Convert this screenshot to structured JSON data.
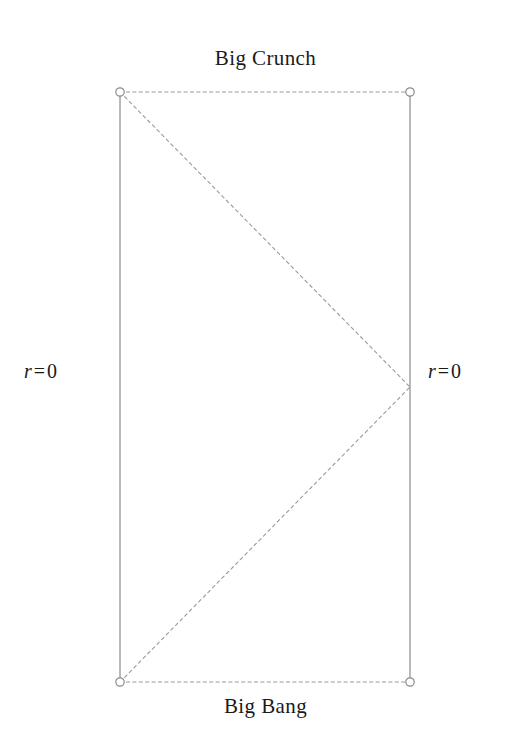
{
  "figure": {
    "type": "conformal-spacetime-diagram",
    "background_color": "#ffffff",
    "width": 507,
    "height": 734,
    "line_color": "#8a8a8a",
    "dotted_color": "#9a9a9a",
    "text_color": "#1a1a1a",
    "vertex_fill": "#ffffff"
  },
  "labels": {
    "top": "Big Crunch",
    "bottom": "Big Bang",
    "left_axis": "r = 0",
    "right_axis": "r = 0",
    "math": {
      "symbol": "r",
      "equals": "=",
      "value": "0"
    }
  },
  "chart_data": {
    "type": "diagram",
    "title": "Big Crunch",
    "subtitle": "Big Bang",
    "xlabel": "",
    "ylabel": "",
    "axis_labels": [
      "r = 0",
      "r = 0"
    ],
    "vertices": [
      {
        "name": "top-left",
        "x": 120,
        "y": 92,
        "marker": "open-circle"
      },
      {
        "name": "top-right",
        "x": 410,
        "y": 92,
        "marker": "open-circle"
      },
      {
        "name": "bottom-left",
        "x": 120,
        "y": 682,
        "marker": "open-circle"
      },
      {
        "name": "bottom-right",
        "x": 410,
        "y": 682,
        "marker": "open-circle"
      },
      {
        "name": "right-apex",
        "x": 410,
        "y": 387,
        "marker": "none"
      }
    ],
    "edges": [
      {
        "name": "left-axis",
        "from": "top-left",
        "to": "bottom-left",
        "style": "solid",
        "meaning": "r = 0"
      },
      {
        "name": "right-axis",
        "from": "top-right",
        "to": "bottom-right",
        "style": "solid",
        "meaning": "r = 0"
      },
      {
        "name": "big-crunch-edge",
        "from": "top-left",
        "to": "top-right",
        "style": "dotted",
        "meaning": "Big Crunch"
      },
      {
        "name": "big-bang-edge",
        "from": "bottom-left",
        "to": "bottom-right",
        "style": "dotted",
        "meaning": "Big Bang"
      },
      {
        "name": "null-ray-upper",
        "from": "top-left",
        "to": "right-apex",
        "style": "dotted",
        "meaning": "null geodesic"
      },
      {
        "name": "null-ray-lower",
        "from": "bottom-left",
        "to": "right-apex",
        "style": "dotted",
        "meaning": "null geodesic"
      }
    ]
  }
}
